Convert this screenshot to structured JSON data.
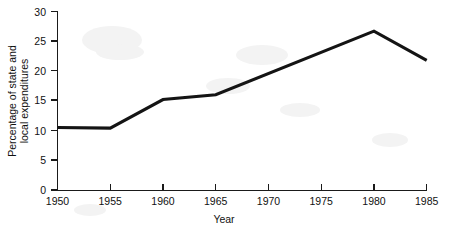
{
  "chart_data": {
    "type": "line",
    "title": "",
    "subtitle": "",
    "xlabel": "Year",
    "ylabel": "Percentage of state and local expenditures",
    "ylabel_line1": "Percentage of state and",
    "ylabel_line2": "local expenditures",
    "x": [
      1950,
      1955,
      1960,
      1965,
      1980,
      1985
    ],
    "values": [
      10.5,
      10.4,
      15.2,
      16.0,
      26.7,
      21.8
    ],
    "series": [
      {
        "name": "Percentage of state and local expenditures",
        "x": [
          1950,
          1955,
          1960,
          1965,
          1980,
          1985
        ],
        "values": [
          10.5,
          10.4,
          15.2,
          16.0,
          26.7,
          21.8
        ]
      }
    ],
    "xlim": [
      1950,
      1985
    ],
    "ylim": [
      0,
      30
    ],
    "xticks": [
      1950,
      1955,
      1960,
      1965,
      1970,
      1975,
      1980,
      1985
    ],
    "yticks": [
      0,
      5,
      10,
      15,
      20,
      25,
      30
    ],
    "xtick_labels": [
      "1950",
      "1955",
      "1960",
      "1965",
      "1970",
      "1975",
      "1980",
      "1985"
    ],
    "ytick_labels": [
      "0",
      "5",
      "10",
      "15",
      "20",
      "25",
      "30"
    ],
    "grid": false,
    "legend": false,
    "legend_position": "none",
    "line_color": "#141414",
    "axis_color": "#1a1a1a",
    "background_color": "#ffffff",
    "annotations": []
  }
}
